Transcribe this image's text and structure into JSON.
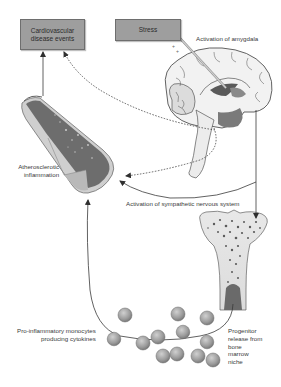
{
  "diagram": {
    "type": "biological-pathway",
    "nodes": {
      "cvd_events": {
        "label_line1": "Cardiovascular",
        "label_line2": "disease events"
      },
      "stress": {
        "label": "Stress"
      },
      "amygdala": {
        "label": "Activation of amygdala"
      },
      "atherosclerosis": {
        "label_line1": "Atherosclerotic",
        "label_line2": "inflammation"
      },
      "sns": {
        "label": "Activation of sympathetic nervous system"
      },
      "monocytes": {
        "label_line1": "Pro-inflammatory monocytes",
        "label_line2": "producing cytokines"
      },
      "progenitor": {
        "lines": [
          "Progenitor",
          "release from",
          "bone",
          "marrow",
          "niche"
        ]
      }
    },
    "edges": [
      {
        "from": "stress",
        "to": "amygdala",
        "style": "pointer"
      },
      {
        "from": "amygdala",
        "to": "bone_marrow",
        "style": "solid",
        "label": "Activation of sympathetic nervous system"
      },
      {
        "from": "amygdala",
        "to": "atherosclerosis",
        "style": "solid"
      },
      {
        "from": "amygdala",
        "to": "cvd_events",
        "style": "dotted"
      },
      {
        "from": "amygdala",
        "to": "atherosclerosis",
        "style": "dotted"
      },
      {
        "from": "atherosclerosis",
        "to": "cvd_events",
        "style": "solid"
      },
      {
        "from": "bone_marrow",
        "to": "monocytes",
        "style": "solid"
      },
      {
        "from": "monocytes",
        "to": "atherosclerosis",
        "style": "solid"
      }
    ],
    "colors": {
      "box_fill": "#9e9e9e",
      "vessel_dark": "#6b6b6b",
      "vessel_light": "#c9c9c9",
      "brain_line": "#3c3c3c",
      "cell_fill": "#a8a8a8",
      "arrow": "#3a3a3a"
    }
  }
}
